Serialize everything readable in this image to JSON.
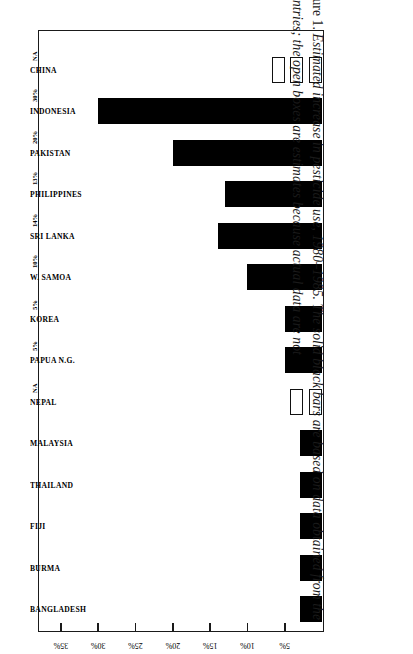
{
  "figure": {
    "caption_lead": "Figure 1.",
    "caption_text": "Estimated increase in pesticide use, 1980–1985. The solid black bars are based on data obtained from the countries; the open boxes are estimates because actual data are not"
  },
  "chart_data": {
    "type": "bar",
    "orientation": "horizontal",
    "title": "",
    "xlabel": "",
    "ylabel": "Percent Increase in Pesticide Use",
    "axis_tick_labels": [
      "5%",
      "10%",
      "15%",
      "20%",
      "25%",
      "30%",
      "35%"
    ],
    "axis_tick_values": [
      5,
      10,
      15,
      20,
      25,
      30,
      35
    ],
    "xlim": [
      0,
      37
    ],
    "grid": false,
    "legend": null,
    "categories": [
      "BANGLADESH",
      "BURMA",
      "FIJI",
      "THAILAND",
      "MALAYSIA",
      "NEPAL",
      "PAPUA N.G.",
      "KOREA",
      "W. SAMOA",
      "SRI LANKA",
      "PHILIPPINES",
      "PAKISTAN",
      "INDONESIA",
      "CHINA"
    ],
    "values": [
      3,
      3,
      3,
      3,
      3,
      null,
      5,
      5,
      10,
      14,
      13,
      20,
      30,
      null
    ],
    "data_labels": [
      "",
      "",
      "",
      "",
      "",
      "NA",
      "5%",
      "5%",
      "10%",
      "14%",
      "13%",
      "20%",
      "30%",
      "NA"
    ],
    "styles": [
      "solid",
      "solid",
      "solid",
      "solid",
      "solid",
      "open-boxes",
      "solid",
      "solid",
      "solid",
      "solid",
      "solid",
      "solid",
      "solid",
      "open-boxes"
    ],
    "open_box_counts": {
      "NEPAL": 2,
      "CHINA": 3
    },
    "colors": {
      "solid_bar": "#000000",
      "open_box_fill": "#ffffff",
      "open_box_border": "#111111",
      "axis": "#1a1a1a",
      "background": "#ffffff"
    }
  }
}
